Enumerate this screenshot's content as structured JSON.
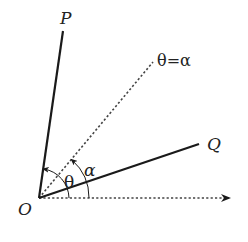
{
  "diagram": {
    "type": "polar-angle-geometry",
    "origin": {
      "label": "O",
      "x": 39,
      "y": 198
    },
    "rays": [
      {
        "name": "OP",
        "label": "P",
        "style": "solid",
        "end": {
          "x": 63,
          "y": 31
        }
      },
      {
        "name": "theta-equals-alpha",
        "label": "θ=α",
        "style": "dotted",
        "end": {
          "x": 153,
          "y": 62
        }
      },
      {
        "name": "OQ",
        "label": "Q",
        "style": "solid",
        "end": {
          "x": 199,
          "y": 144
        }
      },
      {
        "name": "polar-axis",
        "label": "",
        "style": "dotted-arrow",
        "end": {
          "x": 231,
          "y": 199
        }
      }
    ],
    "angles": [
      {
        "label": "θ",
        "from": "polar-axis",
        "to": "OP",
        "radius": 30
      },
      {
        "label": "α",
        "from": "polar-axis",
        "to": "theta-equals-alpha",
        "radius": 50
      }
    ]
  },
  "labels": {
    "P": "P",
    "Q": "Q",
    "O": "O",
    "ray": "θ=α",
    "theta": "θ",
    "alpha": "α"
  },
  "colors": {
    "line": "#1a1a1a",
    "dotted": "#444444",
    "background": "#ffffff"
  }
}
